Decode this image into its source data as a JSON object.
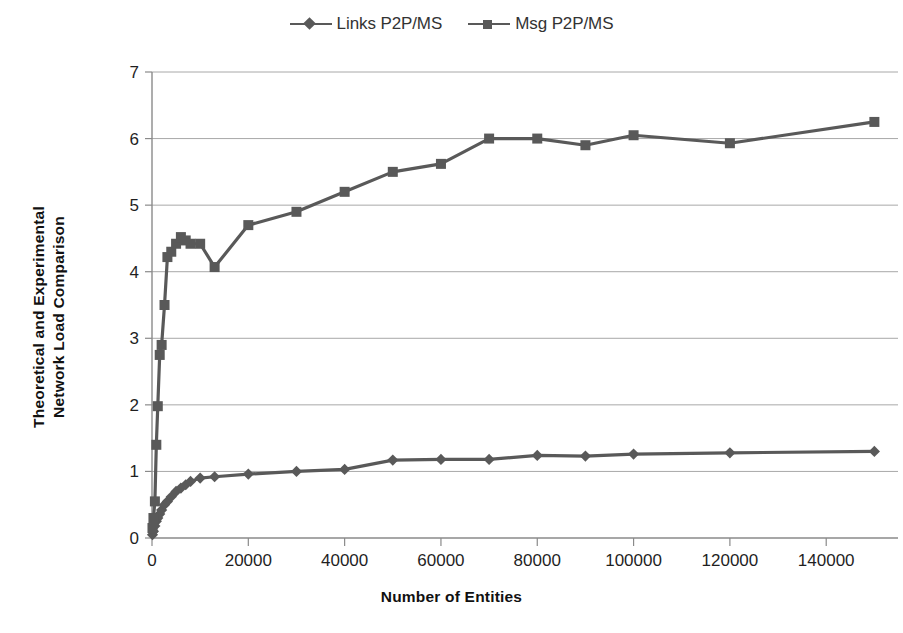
{
  "chart_data": {
    "type": "line",
    "title": "",
    "xlabel": "Number of Entities",
    "ylabel": "Theoretical and Experimental Network Load Comparison",
    "ylabel_line1": "Theoretical and Experimental",
    "ylabel_line2": "Network Load Comparison",
    "xlim": [
      0,
      152000
    ],
    "ylim": [
      0,
      7
    ],
    "grid": true,
    "legend_position": "top-center",
    "x_ticks": [
      0,
      20000,
      40000,
      60000,
      80000,
      100000,
      120000,
      140000
    ],
    "x_tick_labels": [
      "0",
      "20000",
      "40000",
      "60000",
      "80000",
      "100000",
      "120000",
      "140000"
    ],
    "y_ticks": [
      0,
      1,
      2,
      3,
      4,
      5,
      6,
      7
    ],
    "y_tick_labels": [
      "0",
      "1",
      "2",
      "3",
      "4",
      "5",
      "6",
      "7"
    ],
    "series": [
      {
        "name": "Links P2P/MS",
        "marker": "diamond",
        "color": "#595959",
        "x": [
          100,
          300,
          600,
          900,
          1200,
          1600,
          2000,
          2600,
          3200,
          4000,
          5000,
          6000,
          7000,
          8000,
          10000,
          13000,
          20000,
          30000,
          40000,
          50000,
          60000,
          70000,
          80000,
          90000,
          100000,
          120000,
          150000
        ],
        "y": [
          0.05,
          0.1,
          0.18,
          0.25,
          0.3,
          0.36,
          0.42,
          0.5,
          0.55,
          0.62,
          0.7,
          0.75,
          0.8,
          0.85,
          0.9,
          0.92,
          0.96,
          1.0,
          1.03,
          1.17,
          1.18,
          1.18,
          1.24,
          1.23,
          1.26,
          1.28,
          1.3
        ]
      },
      {
        "name": "Msg P2P/MS",
        "marker": "square",
        "color": "#595959",
        "x": [
          100,
          300,
          600,
          900,
          1200,
          1600,
          2000,
          2600,
          3200,
          4000,
          5000,
          6000,
          7000,
          8000,
          10000,
          13000,
          20000,
          30000,
          40000,
          50000,
          60000,
          70000,
          80000,
          90000,
          100000,
          120000,
          150000
        ],
        "y": [
          0.15,
          0.3,
          0.55,
          1.4,
          1.98,
          2.75,
          2.9,
          3.5,
          4.22,
          4.3,
          4.42,
          4.52,
          4.47,
          4.42,
          4.42,
          4.07,
          4.7,
          4.9,
          5.2,
          5.5,
          5.62,
          6.0,
          6.0,
          5.9,
          6.05,
          5.93,
          6.25
        ]
      }
    ]
  },
  "legend": {
    "entries": [
      {
        "label": "Links P2P/MS",
        "marker": "diamond"
      },
      {
        "label": "Msg P2P/MS",
        "marker": "square"
      }
    ]
  },
  "colors": {
    "series": "#595959",
    "gridline": "#a8a8a8",
    "axis": "#8a8a8a",
    "text": "#1a1a1a",
    "background": "#ffffff"
  }
}
